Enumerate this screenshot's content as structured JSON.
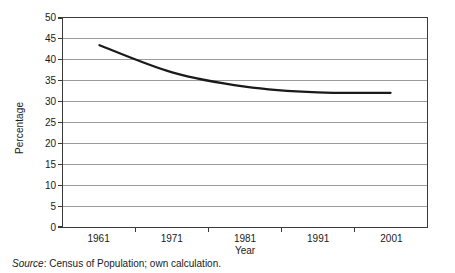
{
  "chart_data": {
    "type": "line",
    "title": "",
    "subtitle": "",
    "xlabel": "Year",
    "ylabel": "Percentage",
    "categories": [
      "1961",
      "1971",
      "1981",
      "1991",
      "2001"
    ],
    "x": [
      1961,
      1971,
      1981,
      1991,
      2001
    ],
    "values": [
      43.5,
      37.0,
      33.6,
      32.2,
      32.1
    ],
    "series": [
      {
        "name": "Percentage",
        "values": [
          43.5,
          37.0,
          33.6,
          32.2,
          32.1
        ]
      }
    ],
    "ylim": [
      0,
      50
    ],
    "ytick_values": [
      0,
      5,
      10,
      15,
      20,
      25,
      30,
      35,
      40,
      45,
      50
    ],
    "ytick_labels": [
      "0",
      "5",
      "10",
      "15",
      "20",
      "25",
      "30",
      "35",
      "40",
      "45",
      "50"
    ],
    "xtick_labels": [
      "1961",
      "1971",
      "1981",
      "1991",
      "2001"
    ],
    "grid": "horizontal",
    "legend": "none",
    "line_color": "#1a1a1a",
    "grid_color": "#9a9a9a",
    "axis_color": "#3a3a3a",
    "background": "#ffffff",
    "annotations": []
  },
  "caption": {
    "source_word": "Source",
    "source_text": ": Census of Population; own calculation."
  }
}
